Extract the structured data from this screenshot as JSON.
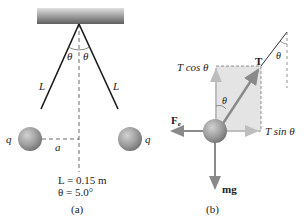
{
  "panel_a": {
    "caption": "(a)",
    "theta_left": "θ",
    "theta_right": "θ",
    "length_left": "L",
    "length_right": "L",
    "charge_left": "q",
    "charge_right": "q",
    "separation": "a",
    "given_L": "L = 0.15 m",
    "given_theta": "θ = 5.0°"
  },
  "panel_b": {
    "caption": "(b)",
    "tension": "T",
    "t_cos": "T cos θ",
    "t_sin": "T sin θ",
    "theta_inner": "θ",
    "theta_string": "θ",
    "electric_force": "F",
    "electric_force_sub": "e",
    "weight": "mg"
  },
  "colors": {
    "sphere": "#9a9a9a",
    "string": "#1a1a1a",
    "arrow": "#8a8a8a",
    "component_box": "#e3e3e3",
    "ceiling_dark": "#6a6a6a",
    "ceiling_light": "#d8d8d8"
  }
}
